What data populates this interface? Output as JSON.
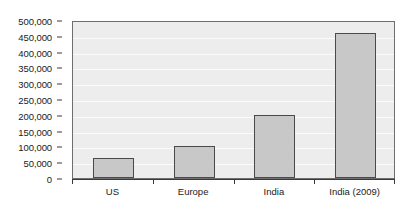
{
  "chart_data": {
    "type": "bar",
    "title": "",
    "subtitle": "",
    "xlabel": "",
    "ylabel": "",
    "categories": [
      "US",
      "Europe",
      "India",
      "India (2009)"
    ],
    "values": [
      63000,
      100000,
      200000,
      460000
    ],
    "ylim": [
      0,
      500000
    ],
    "ytick_values": [
      0,
      50000,
      100000,
      150000,
      200000,
      250000,
      300000,
      350000,
      400000,
      450000,
      500000
    ],
    "ytick_labels": [
      "0",
      "50,000",
      "100,000",
      "150,000",
      "200,000",
      "250,000",
      "300,000",
      "350,000",
      "400,000",
      "450,000",
      "500,000"
    ],
    "grid": true,
    "legend": "none",
    "colors": {
      "bar_fill": "#c8c8c8",
      "bar_border": "#4a4a4a",
      "plot_background": "#ededed",
      "gridline": "#fbfbfb",
      "axis": "#3a3a3a",
      "text": "#1a1a1a",
      "page_background": "#ffffff"
    }
  }
}
